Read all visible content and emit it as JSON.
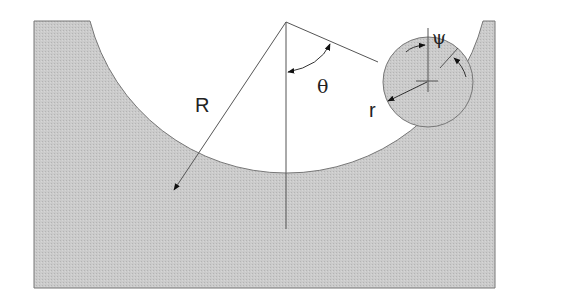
{
  "diagram": {
    "labels": {
      "big_radius": "R",
      "small_radius": "r",
      "angle_theta": "θ",
      "angle_psi": "ψ"
    },
    "colors": {
      "fill": "#c8c8c8",
      "stroke": "#666666",
      "background": "#ffffff"
    }
  }
}
